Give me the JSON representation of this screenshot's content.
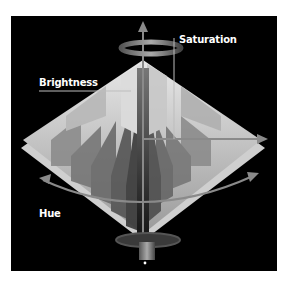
{
  "figure": {
    "labels": {
      "saturation": "Saturation",
      "brightness": "Brightness",
      "hue": "Hue"
    },
    "colors": {
      "background": "#000000",
      "page": "#ffffff",
      "label": "#ffffff",
      "axis": "#8a8a8a"
    }
  }
}
